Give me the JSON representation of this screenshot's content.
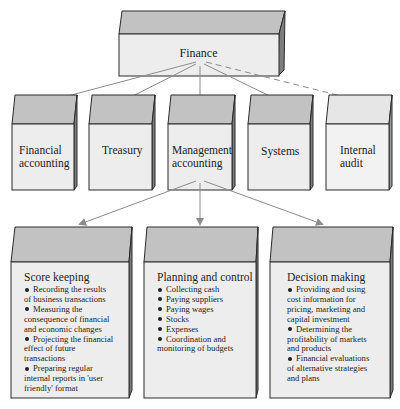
{
  "diagram": {
    "root": {
      "label": "Finance"
    },
    "departments": [
      {
        "label_line1": "Financial",
        "label_line2": "accounting",
        "arrow": "solid"
      },
      {
        "label_line1": "Treasury",
        "label_line2": "",
        "arrow": "solid"
      },
      {
        "label_line1": "Management",
        "label_line2": "accounting",
        "arrow": "solid"
      },
      {
        "label_line1": "Systems",
        "label_line2": "",
        "arrow": "solid"
      },
      {
        "label_line1": "Internal",
        "label_line2": "audit",
        "arrow": "dashed"
      }
    ],
    "management_functions": [
      {
        "title": "Score keeping",
        "items": [
          [
            "Recording the results",
            "of business transactions"
          ],
          [
            "Measuring the",
            "consequence of financial",
            "and economic changes"
          ],
          [
            "Projecting the financial",
            "effect of future",
            "transactions"
          ],
          [
            "Preparing regular",
            "internal reports in 'user",
            "friendly' format"
          ]
        ]
      },
      {
        "title": "Planning and control",
        "items": [
          [
            "Collecting cash"
          ],
          [
            "Paying suppliers"
          ],
          [
            "Paying wages"
          ],
          [
            "Stocks"
          ],
          [
            "Expenses"
          ],
          [
            "Coordination and",
            "monitoring of budgets"
          ]
        ]
      },
      {
        "title": "Decision making",
        "items": [
          [
            "Providing and using",
            "cost information for",
            "pricing, marketing and",
            "capital investment"
          ],
          [
            "Determining the",
            "profitability of markets",
            "and products"
          ],
          [
            "Financial evaluations",
            "of alternative strategies",
            "and plans"
          ]
        ]
      }
    ],
    "colors": {
      "top_face": "#c2c2c2",
      "front_face": "#ededed",
      "side_face": "#8a8a8a",
      "outline": "#2a2a2a",
      "arrow": "#8c8c8c"
    }
  }
}
